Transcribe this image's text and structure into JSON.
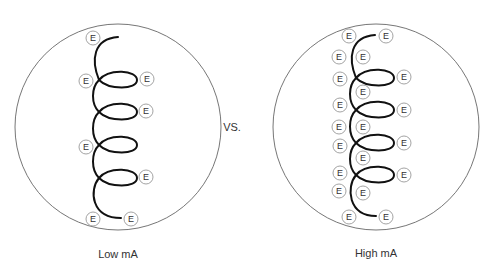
{
  "comparison_word": "VS.",
  "panels": [
    {
      "label": "Low mA",
      "circle": {
        "cx": 118,
        "cy": 127,
        "r": 103
      },
      "coil": {
        "top": [
          118,
          37
        ],
        "bottom": [
          121,
          218
        ],
        "spine_x": 97,
        "loop_right_x": 137,
        "loop_ys": [
          80,
          112,
          145,
          178
        ]
      },
      "electron_symbol": "E",
      "electrons": [
        [
          93,
          38
        ],
        [
          86,
          81
        ],
        [
          147,
          79
        ],
        [
          146,
          111
        ],
        [
          86,
          147
        ],
        [
          146,
          177
        ],
        [
          93,
          219
        ],
        [
          131,
          219
        ]
      ]
    },
    {
      "label": "High mA",
      "circle": {
        "cx": 376,
        "cy": 127,
        "r": 103
      },
      "coil": {
        "top": [
          375,
          35
        ],
        "bottom": [
          376,
          216
        ],
        "spine_x": 354,
        "loop_right_x": 394,
        "loop_ys": [
          78,
          110,
          143,
          175
        ]
      },
      "electron_symbol": "E",
      "electrons": [
        [
          349,
          36
        ],
        [
          386,
          36
        ],
        [
          339,
          57
        ],
        [
          363,
          57
        ],
        [
          340,
          79
        ],
        [
          404,
          77
        ],
        [
          363,
          92
        ],
        [
          340,
          105
        ],
        [
          404,
          110
        ],
        [
          339,
          127
        ],
        [
          363,
          127
        ],
        [
          340,
          146
        ],
        [
          404,
          143
        ],
        [
          363,
          158
        ],
        [
          340,
          173
        ],
        [
          404,
          175
        ],
        [
          339,
          191
        ],
        [
          363,
          193
        ],
        [
          349,
          217
        ],
        [
          386,
          217
        ]
      ]
    }
  ],
  "colors": {
    "circle_stroke": "#666666",
    "coil_stroke": "#111111",
    "electron_stroke": "#999999",
    "text": "#333333"
  }
}
